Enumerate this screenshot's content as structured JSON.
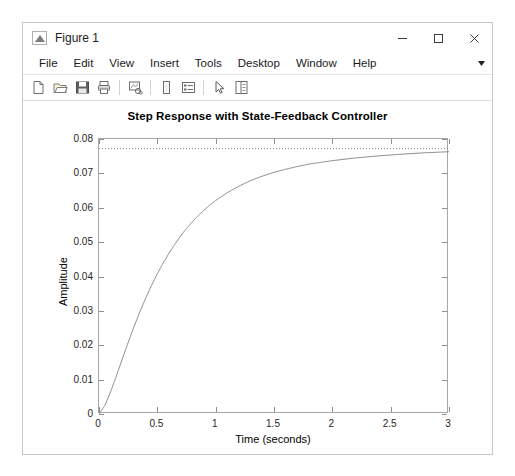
{
  "window": {
    "title": "Figure 1",
    "app_icon": "matlab-figure-icon",
    "controls": {
      "minimize": "–",
      "maximize": "□",
      "close": "✕"
    }
  },
  "menubar": {
    "items": [
      {
        "label": "File"
      },
      {
        "label": "Edit"
      },
      {
        "label": "View"
      },
      {
        "label": "Insert"
      },
      {
        "label": "Tools"
      },
      {
        "label": "Desktop"
      },
      {
        "label": "Window"
      },
      {
        "label": "Help"
      }
    ],
    "overflow": "▾"
  },
  "toolbar": {
    "buttons": [
      {
        "name": "new-figure-icon",
        "title": "New Figure"
      },
      {
        "name": "open-file-icon",
        "title": "Open File"
      },
      {
        "name": "save-figure-icon",
        "title": "Save Figure"
      },
      {
        "name": "print-figure-icon",
        "title": "Print Figure"
      },
      {
        "name": "link-plot-icon",
        "title": "Link Plot"
      },
      {
        "name": "insert-colorbar-icon",
        "title": "Insert Colorbar"
      },
      {
        "name": "insert-legend-icon",
        "title": "Insert Legend"
      },
      {
        "name": "edit-plot-arrow-icon",
        "title": "Edit Plot"
      },
      {
        "name": "show-plot-tools-icon",
        "title": "Show Plot Tools and Dock Figure"
      }
    ]
  },
  "chart_data": {
    "type": "line",
    "title": "Step Response with State-Feedback Controller",
    "xlabel": "Time (seconds)",
    "ylabel": "Amplitude",
    "xlim": [
      0,
      3
    ],
    "ylim": [
      0,
      0.08
    ],
    "xticks": [
      0,
      0.5,
      1,
      1.5,
      2,
      2.5,
      3
    ],
    "xticklabels": [
      "0",
      "0.5",
      "1",
      "1.5",
      "2",
      "2.5",
      "3"
    ],
    "yticks": [
      0,
      0.01,
      0.02,
      0.03,
      0.04,
      0.05,
      0.06,
      0.07,
      0.08
    ],
    "yticklabels": [
      "0",
      "0.01",
      "0.02",
      "0.03",
      "0.04",
      "0.05",
      "0.06",
      "0.07",
      "0.08"
    ],
    "grid": false,
    "legend": null,
    "line_color": "#8c8c8c",
    "reference_line": {
      "name": "steady-state-value",
      "style": "dotted",
      "y": 0.0772,
      "color": "#8c8c8c"
    },
    "series": [
      {
        "name": "step-response",
        "x": [
          0,
          0.05,
          0.1,
          0.15,
          0.2,
          0.25,
          0.3,
          0.35,
          0.4,
          0.45,
          0.5,
          0.55,
          0.6,
          0.65,
          0.7,
          0.75,
          0.8,
          0.85,
          0.9,
          0.95,
          1.0,
          1.1,
          1.2,
          1.3,
          1.4,
          1.5,
          1.6,
          1.7,
          1.8,
          1.9,
          2.0,
          2.2,
          2.4,
          2.6,
          2.8,
          3.0
        ],
        "y": [
          0.0,
          0.0025,
          0.0065,
          0.0112,
          0.016,
          0.0208,
          0.0254,
          0.0297,
          0.0337,
          0.0374,
          0.0408,
          0.0439,
          0.0468,
          0.0494,
          0.0518,
          0.054,
          0.0559,
          0.0577,
          0.0593,
          0.0608,
          0.0621,
          0.0644,
          0.0663,
          0.0679,
          0.0692,
          0.0703,
          0.0712,
          0.072,
          0.0727,
          0.0732,
          0.0737,
          0.0745,
          0.0751,
          0.0756,
          0.076,
          0.0763
        ]
      }
    ]
  }
}
